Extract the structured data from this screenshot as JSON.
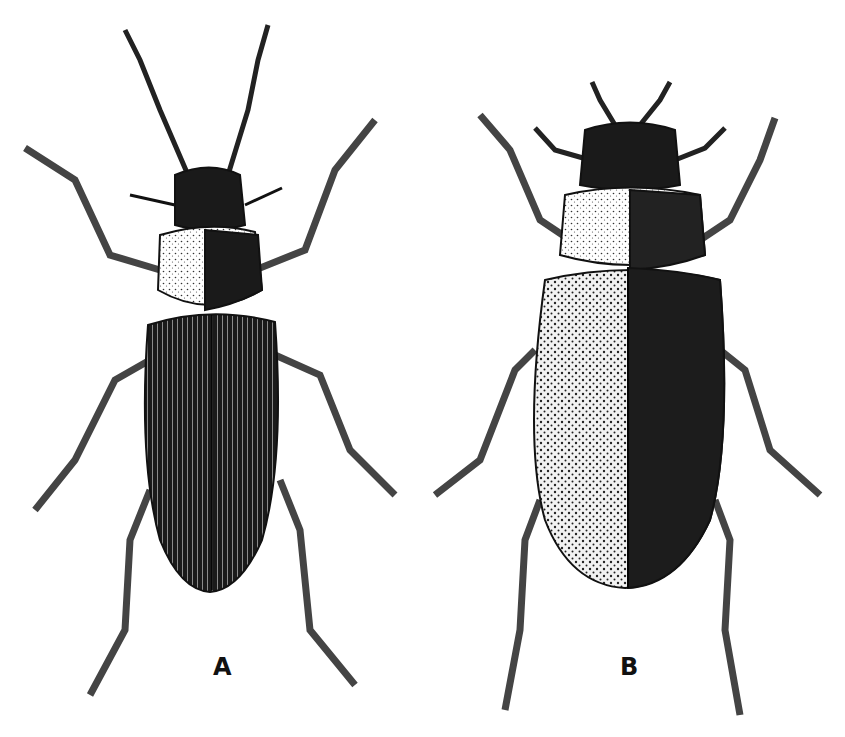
{
  "figure": {
    "panels": [
      {
        "label": "A",
        "description": "narrow ground beetle, dorsal view, long antennae, striate elytra"
      },
      {
        "label": "B",
        "description": "broad ground beetle, dorsal view, short antennae, punctate elytra"
      }
    ],
    "colors": {
      "ink": "#111111",
      "paper": "#ffffff",
      "stipple": "#d8d8d8"
    }
  }
}
